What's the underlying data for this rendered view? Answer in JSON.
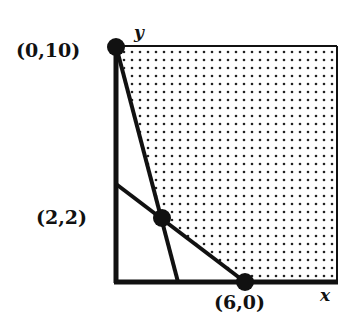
{
  "diagram": {
    "type": "linear-programming-feasible-region",
    "axes": {
      "x_label": "x",
      "y_label": "y"
    },
    "points": [
      {
        "id": "p1",
        "label": "(0,10)",
        "x": 0,
        "y": 10
      },
      {
        "id": "p2",
        "label": "(2,2)",
        "x": 2,
        "y": 2
      },
      {
        "id": "p3",
        "label": "(6,0)",
        "x": 6,
        "y": 0
      }
    ],
    "lines": [
      {
        "id": "steep-line",
        "from": "(0,10)",
        "through": "(2,2)"
      },
      {
        "id": "shallow-line",
        "from": "y-axis",
        "through": "(2,2)",
        "to": "(6,0)"
      }
    ],
    "region": {
      "fill": "dotted",
      "description": "unbounded feasible region above both lines"
    },
    "colors": {
      "ink": "#111111",
      "background": "#ffffff"
    }
  }
}
